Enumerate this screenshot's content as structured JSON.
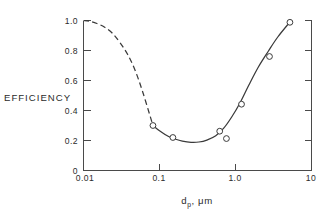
{
  "chart_data": {
    "type": "line",
    "title": "",
    "subtitle": "",
    "xlabel": "d_p, μm",
    "xlabel_base": "d",
    "xlabel_sub": "p",
    "xlabel_rest": ", μm",
    "ylabel": "EFFICIENCY",
    "xscale": "log",
    "yscale": "linear",
    "xlim": [
      0.01,
      10
    ],
    "ylim": [
      0.0,
      1.0
    ],
    "grid": false,
    "legend": null,
    "xticks": [
      0.01,
      0.1,
      1.0,
      10
    ],
    "xtick_labels": [
      "0.01",
      "0.1",
      "1.0",
      "10"
    ],
    "yticks": [
      0.0,
      0.2,
      0.4,
      0.6,
      0.8,
      1.0
    ],
    "ytick_labels": [
      "0",
      "0.2",
      "0.4",
      "0.6",
      "0.8",
      "1.0"
    ],
    "series": [
      {
        "name": "fitted curve (extrapolated)",
        "style": "dashed",
        "marker": "none",
        "x": [
          0.01,
          0.012,
          0.015,
          0.019,
          0.024,
          0.03,
          0.038,
          0.048,
          0.06,
          0.075,
          0.082
        ],
        "y": [
          1.0,
          0.995,
          0.98,
          0.955,
          0.915,
          0.855,
          0.775,
          0.665,
          0.525,
          0.365,
          0.3
        ]
      },
      {
        "name": "fitted curve (measured)",
        "style": "solid",
        "marker": "none",
        "x": [
          0.082,
          0.1,
          0.13,
          0.16,
          0.2,
          0.26,
          0.33,
          0.42,
          0.55,
          0.7,
          0.9,
          1.15,
          1.5,
          2.0,
          2.7,
          3.6,
          5.2
        ],
        "y": [
          0.3,
          0.265,
          0.228,
          0.21,
          0.196,
          0.188,
          0.19,
          0.203,
          0.232,
          0.282,
          0.36,
          0.452,
          0.57,
          0.69,
          0.795,
          0.89,
          0.99
        ]
      },
      {
        "name": "measured data points",
        "style": "none",
        "marker": "open-circle",
        "x": [
          0.082,
          0.15,
          0.62,
          0.76,
          1.2,
          2.8,
          5.2
        ],
        "y": [
          0.3,
          0.22,
          0.262,
          0.213,
          0.442,
          0.76,
          0.988
        ]
      }
    ],
    "annotations": []
  },
  "figure": {
    "background_color": "#ffffff",
    "line_color": "#3a3a3a",
    "axis_color": "#4a4a4a",
    "marker_fill": "#ffffff"
  }
}
